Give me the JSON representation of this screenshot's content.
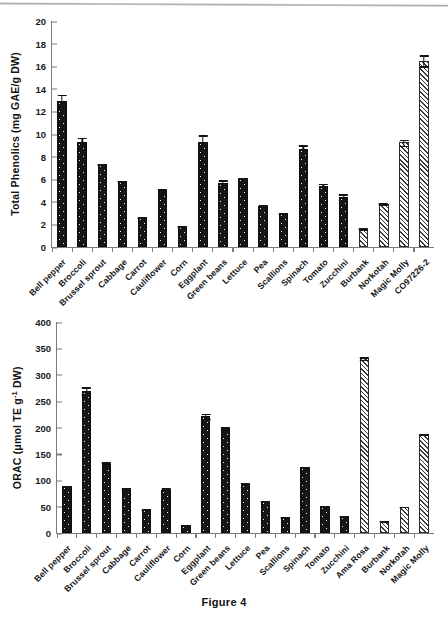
{
  "figure": {
    "caption": "Figure 4"
  },
  "chart_data": [
    {
      "type": "bar",
      "id": "total-phenolics",
      "title": "",
      "xlabel": "",
      "ylabel": "Total Phenolics (mg GAE/g DW)",
      "ylabel_parts": {
        "prefix": "Total Phenolics (mg GAE/g DW)"
      },
      "ylim": [
        0,
        20
      ],
      "ytick_step": 2,
      "yticks": [
        "0",
        "2",
        "4",
        "6",
        "8",
        "10",
        "12",
        "14",
        "16",
        "18",
        "20"
      ],
      "grid": false,
      "legend": "none",
      "categories": [
        "Bell pepper",
        "Broccoli",
        "Brussel sprout",
        "Cabbage",
        "Carrot",
        "Cauliflower",
        "Corn",
        "Eggplant",
        "Green beans",
        "Lettuce",
        "Pea",
        "Scallions",
        "Spinach",
        "Tomato",
        "Zucchini",
        "Burbank",
        "Norkotah",
        "Magic Molly",
        "CO97226-2"
      ],
      "values": [
        12.95,
        9.3,
        7.35,
        5.85,
        2.65,
        5.05,
        1.85,
        9.3,
        5.65,
        6.1,
        3.65,
        3.0,
        8.65,
        5.4,
        4.45,
        1.6,
        3.85,
        9.25,
        16.5
      ],
      "errors": [
        0.6,
        0.45,
        0.05,
        0.08,
        0.05,
        0.2,
        0.07,
        0.7,
        0.35,
        0.1,
        0.15,
        0.12,
        0.45,
        0.3,
        0.3,
        0.15,
        0.1,
        0.35,
        0.55
      ],
      "fills": [
        "solid",
        "solid",
        "solid",
        "solid",
        "solid",
        "solid",
        "solid",
        "solid",
        "solid",
        "solid",
        "solid",
        "solid",
        "solid",
        "solid",
        "solid",
        "hatch",
        "hatch",
        "hatch",
        "hatch"
      ]
    },
    {
      "type": "bar",
      "id": "orac",
      "title": "",
      "xlabel": "",
      "ylabel": "ORAC (umol TE g-1 DW)",
      "ylabel_parts": {
        "prefix": "ORAC (μmol TE g",
        "sup": "-1",
        "suffix": " DW)"
      },
      "ylim": [
        0,
        400
      ],
      "ytick_step": 50,
      "yticks": [
        "0",
        "50",
        "100",
        "150",
        "200",
        "250",
        "300",
        "350",
        "400"
      ],
      "grid": false,
      "legend": "none",
      "categories": [
        "Bell pepper",
        "Broccoli",
        "Brussel sprout",
        "Cabbage",
        "Carrot",
        "Cauliflower",
        "Corn",
        "Eggplant",
        "Green beans",
        "Lettuce",
        "Pea",
        "Scallions",
        "Spinach",
        "Tomato",
        "Zucchini",
        "Ama Rosa",
        "Burbank",
        "Norkotah",
        "Magic Molly"
      ],
      "values": [
        90,
        270,
        131,
        85,
        45,
        81,
        16,
        222,
        199,
        92,
        61,
        30,
        125,
        52,
        32,
        331,
        23,
        50,
        188
      ],
      "errors": [
        1.5,
        8,
        5,
        3,
        2,
        6,
        1,
        6,
        4,
        5,
        2,
        1.5,
        1.5,
        1.5,
        1,
        4,
        1,
        1.5,
        2
      ],
      "fills": [
        "solid",
        "solid",
        "solid",
        "solid",
        "solid",
        "solid",
        "solid",
        "solid",
        "solid",
        "solid",
        "solid",
        "solid",
        "solid",
        "solid",
        "solid",
        "hatch",
        "hatch",
        "hatch",
        "hatch"
      ]
    }
  ]
}
